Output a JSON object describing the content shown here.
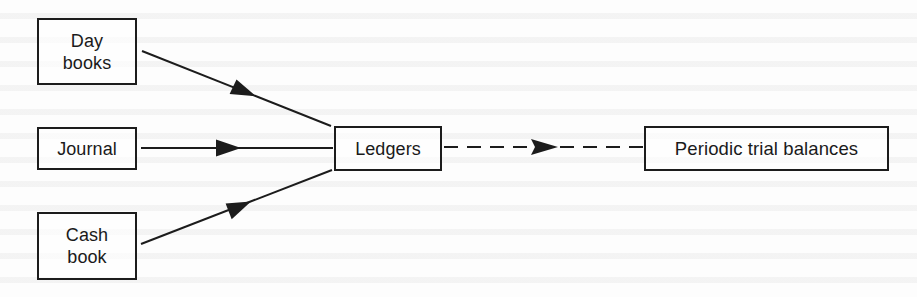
{
  "diagram": {
    "type": "flow",
    "nodes": [
      {
        "id": "day-books",
        "label": "Day\nbooks"
      },
      {
        "id": "journal",
        "label": "Journal"
      },
      {
        "id": "cash-book",
        "label": "Cash\nbook"
      },
      {
        "id": "ledgers",
        "label": "Ledgers"
      },
      {
        "id": "periodic-trial-balances",
        "label": "Periodic trial balances"
      }
    ],
    "edges": [
      {
        "from": "day-books",
        "to": "ledgers",
        "style": "solid"
      },
      {
        "from": "journal",
        "to": "ledgers",
        "style": "solid"
      },
      {
        "from": "cash-book",
        "to": "ledgers",
        "style": "solid"
      },
      {
        "from": "ledgers",
        "to": "periodic-trial-balances",
        "style": "dashed"
      }
    ],
    "colors": {
      "stroke": "#1c1c1c",
      "background": "#fdfdfd"
    }
  }
}
